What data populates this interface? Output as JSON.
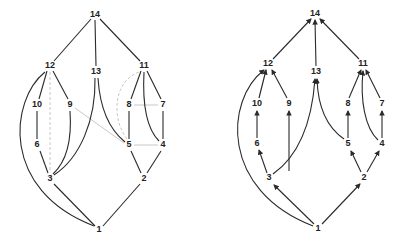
{
  "left_graph": {
    "nodes": [
      {
        "id": "14",
        "x": 95,
        "y": 15
      },
      {
        "id": "12",
        "x": 50,
        "y": 66
      },
      {
        "id": "13",
        "x": 96,
        "y": 72
      },
      {
        "id": "11",
        "x": 144,
        "y": 66
      },
      {
        "id": "10",
        "x": 37,
        "y": 105
      },
      {
        "id": "9",
        "x": 70,
        "y": 105
      },
      {
        "id": "8",
        "x": 129,
        "y": 105
      },
      {
        "id": "7",
        "x": 163,
        "y": 105
      },
      {
        "id": "6",
        "x": 37,
        "y": 145
      },
      {
        "id": "5",
        "x": 129,
        "y": 145
      },
      {
        "id": "4",
        "x": 163,
        "y": 145
      },
      {
        "id": "3",
        "x": 50,
        "y": 179
      },
      {
        "id": "2",
        "x": 144,
        "y": 179
      },
      {
        "id": "1",
        "x": 99,
        "y": 230
      }
    ]
  },
  "right_graph": {
    "nodes": [
      {
        "id": "14",
        "x": 315,
        "y": 14
      },
      {
        "id": "12",
        "x": 268,
        "y": 64
      },
      {
        "id": "13",
        "x": 316,
        "y": 72
      },
      {
        "id": "11",
        "x": 363,
        "y": 64
      },
      {
        "id": "10",
        "x": 257,
        "y": 104
      },
      {
        "id": "9",
        "x": 289,
        "y": 104
      },
      {
        "id": "8",
        "x": 348,
        "y": 104
      },
      {
        "id": "7",
        "x": 382,
        "y": 104
      },
      {
        "id": "6",
        "x": 257,
        "y": 144
      },
      {
        "id": "5",
        "x": 348,
        "y": 144
      },
      {
        "id": "4",
        "x": 382,
        "y": 144
      },
      {
        "id": "3",
        "x": 269,
        "y": 178
      },
      {
        "id": "2",
        "x": 364,
        "y": 178
      },
      {
        "id": "1",
        "x": 318,
        "y": 229
      }
    ]
  },
  "edges": [
    [
      "1",
      "3"
    ],
    [
      "1",
      "3c"
    ],
    [
      "1",
      "2"
    ],
    [
      "3",
      "6"
    ],
    [
      "3",
      "9"
    ],
    [
      "3",
      "13"
    ],
    [
      "1",
      "12c"
    ],
    [
      "6",
      "10"
    ],
    [
      "10",
      "12"
    ],
    [
      "9",
      "12"
    ],
    [
      "12",
      "14"
    ],
    [
      "13",
      "14"
    ],
    [
      "11",
      "14"
    ],
    [
      "2",
      "5"
    ],
    [
      "2",
      "4"
    ],
    [
      "5",
      "8"
    ],
    [
      "5",
      "13"
    ],
    [
      "4",
      "7"
    ],
    [
      "4",
      "11"
    ],
    [
      "8",
      "11"
    ],
    [
      "7",
      "11"
    ]
  ],
  "gray_edges_left": [
    [
      "12",
      "3",
      "dashed"
    ],
    [
      "9",
      "5",
      "solid"
    ],
    [
      "11",
      "5",
      "dashed"
    ],
    [
      "8",
      "7",
      "solid"
    ],
    [
      "5",
      "4",
      "solid"
    ]
  ]
}
